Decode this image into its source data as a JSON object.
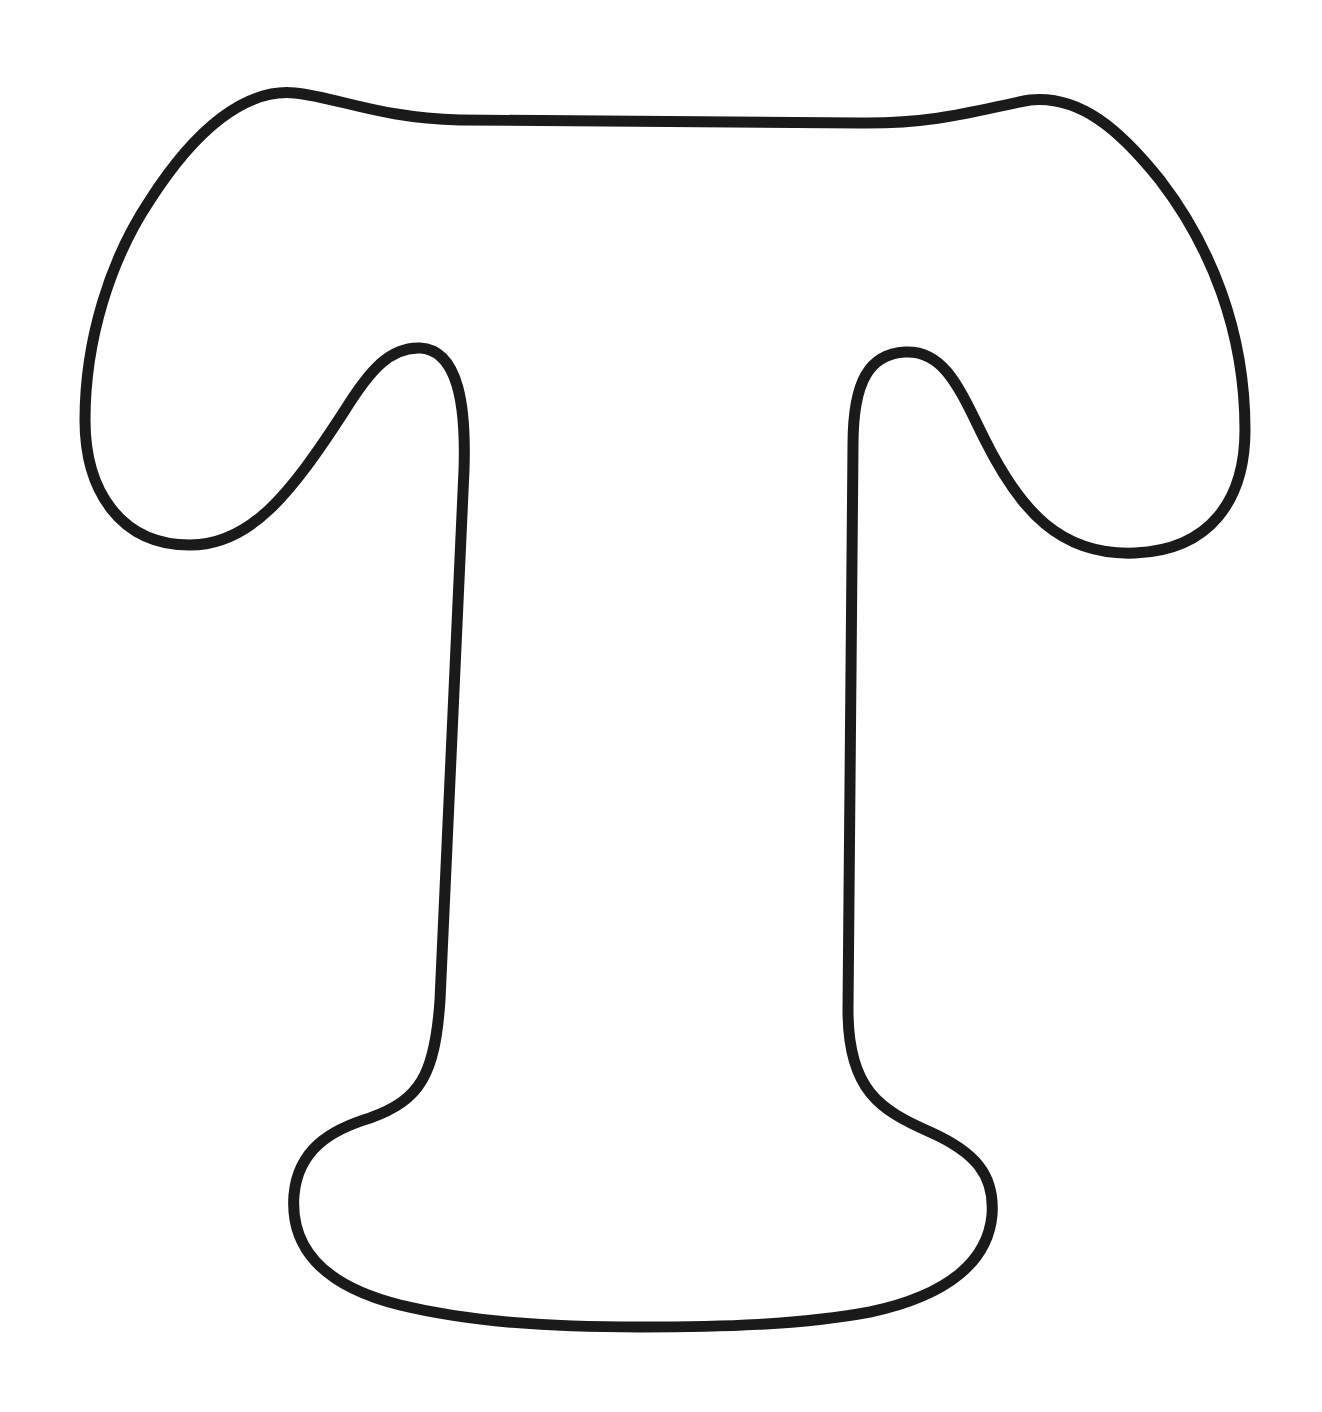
{
  "page": {
    "background_color": "#ffffff",
    "width": 1322,
    "height": 1412
  },
  "figure": {
    "letter": "T",
    "style": "coloring-page outline",
    "stroke_color": "#1a1a1a",
    "stroke_width": 11,
    "fill_color": "#ffffff",
    "path": "M 295 93 C 340 98 380 118 460 120 L 860 123 C 940 124 985 108 1030 100 C 1080 95 1120 130 1160 180 C 1210 245 1245 330 1245 430 C 1245 500 1210 550 1135 553 C 1060 556 1020 510 985 440 C 960 390 945 350 905 352 C 870 354 853 380 853 445 L 848 1010 C 848 1090 880 1110 930 1132 C 975 1152 995 1175 992 1215 C 988 1260 950 1295 870 1312 C 800 1325 720 1327 640 1327 C 550 1327 470 1322 400 1305 C 320 1285 290 1245 294 1195 C 298 1150 330 1130 370 1118 C 420 1100 435 1075 440 1000 L 464 470 C 466 410 460 350 420 348 C 390 347 370 370 345 410 C 290 495 250 545 190 545 C 120 545 85 490 85 420 C 85 340 110 260 150 200 C 195 130 245 88 295 93 Z"
  }
}
